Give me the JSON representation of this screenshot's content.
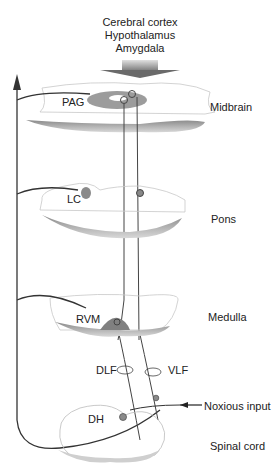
{
  "figure": {
    "top_inputs": [
      "Cerebral cortex",
      "Hypothalamus",
      "Amygdala"
    ],
    "levels": [
      {
        "name": "Midbrain",
        "nucleus": "PAG"
      },
      {
        "name": "Pons",
        "nucleus": "LC"
      },
      {
        "name": "Medulla",
        "nucleus": "RVM"
      },
      {
        "name": "Spinal cord",
        "nucleus": "DH"
      }
    ],
    "tracts": [
      "DLF",
      "VLF"
    ],
    "input_label": "Noxious input"
  },
  "colors": {
    "line": "#333333",
    "tissue_fill": "#9a9a9a",
    "tissue_light": "#d5d5d5",
    "outline": "#bbbbbb"
  }
}
